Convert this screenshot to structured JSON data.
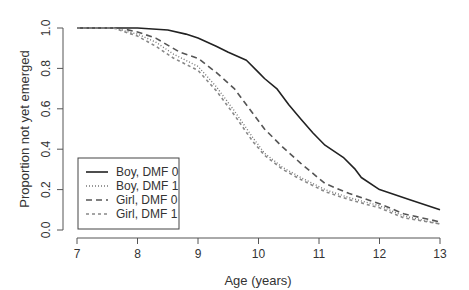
{
  "chart_data": {
    "type": "line",
    "title": "",
    "xlabel": "Age (years)",
    "ylabel": "Proportion not yet emerged",
    "xlim": [
      7,
      13
    ],
    "ylim": [
      0,
      1
    ],
    "xticks": [
      "7",
      "8",
      "9",
      "10",
      "11",
      "12",
      "13"
    ],
    "yticks": [
      "0.0",
      "0.2",
      "0.4",
      "0.6",
      "0.8",
      "1.0"
    ],
    "grid": false,
    "legend_position": "bottom-left",
    "series": [
      {
        "name": "Boy, DMF 0",
        "style": "solid",
        "color": "#222222",
        "x": [
          7.0,
          8.0,
          8.5,
          8.8,
          9.0,
          9.3,
          9.5,
          9.8,
          10.0,
          10.1,
          10.3,
          10.5,
          10.7,
          10.9,
          11.1,
          11.4,
          11.6,
          11.7,
          12.0,
          12.5,
          13.0
        ],
        "y": [
          1.0,
          1.0,
          0.99,
          0.97,
          0.95,
          0.91,
          0.88,
          0.84,
          0.78,
          0.75,
          0.7,
          0.62,
          0.55,
          0.48,
          0.42,
          0.36,
          0.3,
          0.26,
          0.2,
          0.15,
          0.1
        ]
      },
      {
        "name": "Boy, DMF 1",
        "style": "dotted",
        "color": "#777777",
        "x": [
          7.0,
          7.6,
          8.0,
          8.3,
          8.6,
          9.0,
          9.3,
          9.6,
          9.9,
          10.1,
          10.4,
          10.7,
          11.1,
          11.5,
          12.0,
          12.4,
          13.0
        ],
        "y": [
          1.0,
          1.0,
          0.97,
          0.93,
          0.87,
          0.81,
          0.71,
          0.59,
          0.46,
          0.38,
          0.31,
          0.26,
          0.2,
          0.16,
          0.12,
          0.07,
          0.03
        ]
      },
      {
        "name": "Girl, DMF 0",
        "style": "long-dash",
        "color": "#555555",
        "x": [
          7.0,
          7.7,
          8.0,
          8.3,
          8.7,
          9.0,
          9.3,
          9.6,
          9.8,
          10.1,
          10.4,
          10.7,
          11.1,
          11.5,
          12.0,
          12.4,
          13.0
        ],
        "y": [
          1.0,
          1.0,
          0.98,
          0.95,
          0.88,
          0.85,
          0.78,
          0.7,
          0.62,
          0.5,
          0.41,
          0.33,
          0.23,
          0.18,
          0.13,
          0.08,
          0.04
        ]
      },
      {
        "name": "Girl, DMF 1",
        "style": "short-dash",
        "color": "#888888",
        "x": [
          7.0,
          7.6,
          8.0,
          8.3,
          8.6,
          9.0,
          9.3,
          9.6,
          9.9,
          10.1,
          10.4,
          10.7,
          11.1,
          11.5,
          12.0,
          12.4,
          13.0
        ],
        "y": [
          1.0,
          1.0,
          0.96,
          0.91,
          0.85,
          0.79,
          0.69,
          0.57,
          0.44,
          0.37,
          0.3,
          0.25,
          0.19,
          0.15,
          0.11,
          0.06,
          0.03
        ]
      }
    ]
  }
}
